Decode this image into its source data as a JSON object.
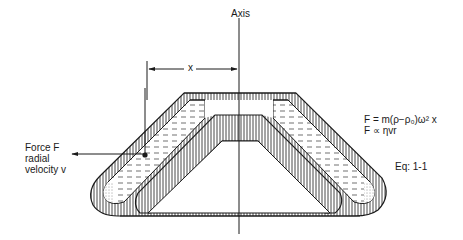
{
  "diagram": {
    "axis_label": "Axis",
    "dimension_label": "x",
    "force_label": [
      "Force F",
      "radial",
      "velocity v"
    ],
    "equations": [
      "F = m(ρ−ρ₀)ω² x",
      "F ∝ ηvr"
    ],
    "equation_number": "Eq: 1-1",
    "components": [
      "rotation-axis",
      "rotor-body-hatched",
      "centrifuge-tube-left",
      "centrifuge-tube-right",
      "liquid-medium",
      "sediment-pellet",
      "particle-dot",
      "force-arrow",
      "radius-dimension"
    ],
    "colors": {
      "line": "#1a1a1a",
      "background": "#ffffff"
    }
  }
}
